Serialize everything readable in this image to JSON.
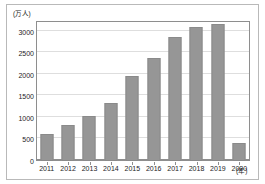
{
  "figure": {
    "background_color": "#ffffff",
    "frame_color": "#b9b9b9",
    "axis_color": "#8e8e8e",
    "grid_color": "#dedede",
    "bar_color": "#969696"
  },
  "axes": {
    "y_unit_label": "(万人)",
    "x_unit_label": "(年)",
    "y_ticks": [
      "0",
      "500",
      "1000",
      "1500",
      "2000",
      "2500",
      "3000"
    ],
    "x_ticks": [
      "2011",
      "2012",
      "2013",
      "2014",
      "2015",
      "2016",
      "2017",
      "2018",
      "2019",
      "2020"
    ]
  },
  "chart_data": {
    "type": "bar",
    "title": "",
    "xlabel": "(年)",
    "ylabel": "(万人)",
    "categories": [
      "2011",
      "2012",
      "2013",
      "2014",
      "2015",
      "2016",
      "2017",
      "2018",
      "2019",
      "2020"
    ],
    "values": [
      620,
      840,
      1040,
      1340,
      1970,
      2400,
      2870,
      3120,
      3190,
      410
    ],
    "ylim": [
      0,
      3250
    ],
    "ytick_values": [
      0,
      500,
      1000,
      1500,
      2000,
      2500,
      3000
    ],
    "grid": true,
    "grid_axis": "y",
    "legend": false,
    "series": [
      {
        "name": "訪日外客数",
        "values": [
          620,
          840,
          1040,
          1340,
          1970,
          2400,
          2870,
          3120,
          3190,
          410
        ]
      }
    ]
  }
}
